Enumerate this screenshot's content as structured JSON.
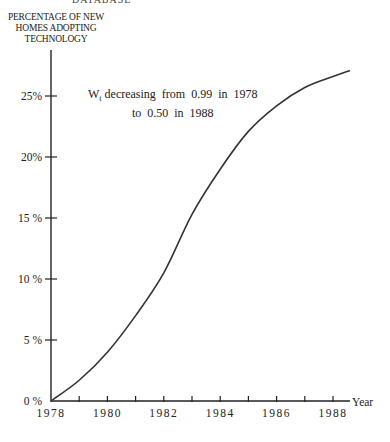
{
  "header_fragment": "DATABASE",
  "chart_data": {
    "type": "line",
    "title": "",
    "ylabel": "PERCENTAGE OF NEW HOMES ADOPTING TECHNOLOGY",
    "xlabel": "Year",
    "x_ticks": [
      1978,
      1979,
      1980,
      1981,
      1982,
      1983,
      1984,
      1985,
      1986,
      1987,
      1988
    ],
    "x_tick_labels": [
      "1978",
      "1980",
      "1982",
      "1984",
      "1986",
      "1988"
    ],
    "y_ticks": [
      0,
      5,
      10,
      15,
      20,
      25
    ],
    "y_tick_labels": [
      "0 %",
      "5 %",
      "10 %",
      "15 %",
      "20%",
      "25%"
    ],
    "xlim": [
      1978,
      1988.6
    ],
    "ylim": [
      0,
      28.5
    ],
    "grid": false,
    "legend": null,
    "annotation": {
      "line1_prefix": "W",
      "line1_sub": "t",
      "line1_rest": " decreasing  from  0.99  in  1978",
      "line2": "to  0.50  in  1988"
    },
    "series": [
      {
        "name": "Adoption",
        "x": [
          1978,
          1979,
          1980,
          1981,
          1982,
          1983,
          1984,
          1985,
          1986,
          1987,
          1988,
          1988.6
        ],
        "values": [
          0,
          1.7,
          4.0,
          7.0,
          10.5,
          15.3,
          19.0,
          22.1,
          24.2,
          25.7,
          26.6,
          27.1
        ]
      }
    ]
  }
}
